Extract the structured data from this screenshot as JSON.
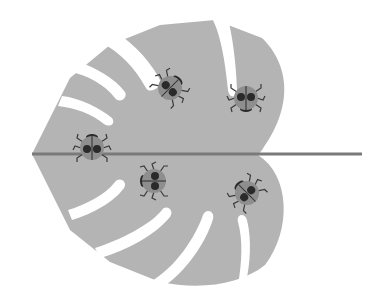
{
  "illustration": {
    "subject": "Monstera leaf with ladybugs",
    "colors": {
      "background": "#ffffff",
      "leaf": "#b4b4b4",
      "stem": "#7a7a7a",
      "ladybug_shell": "#8e8e8e",
      "ladybug_spots": "#2a2a2a",
      "ladybug_legs": "#3a3a3a"
    },
    "stem": {
      "x1": 32,
      "x2": 362,
      "y": 154
    },
    "ladybugs": [
      {
        "id": "top-left",
        "cx": 170,
        "cy": 88,
        "rotate": -45
      },
      {
        "id": "top-right",
        "cx": 246,
        "cy": 98,
        "rotate": 0
      },
      {
        "id": "left-on-stem",
        "cx": 92,
        "cy": 148,
        "rotate": 0
      },
      {
        "id": "center-bottom",
        "cx": 154,
        "cy": 181,
        "rotate": 90
      },
      {
        "id": "right-bottom",
        "cx": 247,
        "cy": 193,
        "rotate": 60
      }
    ],
    "ladybug_count": 5
  }
}
